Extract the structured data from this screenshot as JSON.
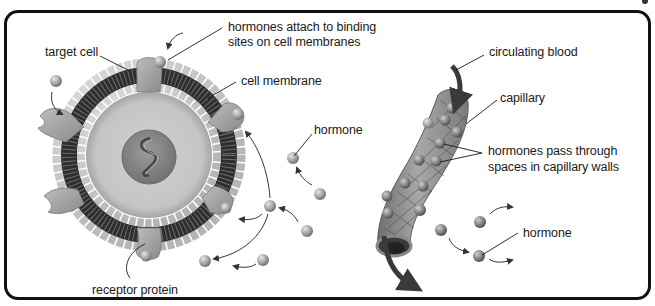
{
  "diagram": {
    "colors": {
      "frame": "#111111",
      "background": "#ffffff",
      "hormone": "#a8a8a8",
      "hormone_dark": "#7f7f7f",
      "membrane_dark": "#2e2e2e",
      "cytoplasm": "#c9c9c9",
      "nucleus": "#8e8e8e",
      "receptor": "#a0a0a0",
      "capillary": "#9a9a9a",
      "arrow": "#333333"
    },
    "labels": {
      "target_cell": "target cell",
      "attach_line1": "hormones attach to binding",
      "attach_line2": "sites on cell membranes",
      "cell_membrane": "cell membrane",
      "hormone_left": "hormone",
      "receptor_protein": "receptor protein",
      "circulating_blood": "circulating blood",
      "capillary": "capillary",
      "pass_line1": "hormones pass through",
      "pass_line2": "spaces in capillary walls",
      "hormone_right": "hormone"
    }
  }
}
